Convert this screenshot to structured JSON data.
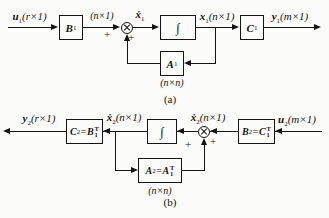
{
  "fig_a": {
    "caption": "(a)",
    "input": {
      "base": "u",
      "sub": "1",
      "dims": "(r×1)"
    },
    "block_B": {
      "base": "B",
      "sub": "1"
    },
    "dim_n1": "(n×1)",
    "plus_left": "+",
    "plus_right": "+",
    "xdot": {
      "base": "ẋ",
      "sub": "1",
      "dims": ""
    },
    "integrator": "∫",
    "state": {
      "base": "x",
      "sub": "1",
      "dims": "(n×1)"
    },
    "block_C": {
      "base": "C",
      "sub": "1"
    },
    "output": {
      "base": "y",
      "sub": "1",
      "dims": "(m×1)"
    },
    "block_A": {
      "base": "A",
      "sub": "1"
    },
    "dim_nn": "(n×n)"
  },
  "fig_b": {
    "caption": "(b)",
    "output": {
      "base": "y",
      "sub": "2",
      "dims": "(r×1)"
    },
    "block_C": {
      "lhs": "C",
      "lhs_sub": "2",
      "eq": "=",
      "rhs": "B",
      "rhs_sub": "1",
      "rhs_sup": "T"
    },
    "state": {
      "base": "ẋ",
      "sub": "2",
      "dims": "(n×1)"
    },
    "integrator": "∫",
    "xdot": {
      "base": "ẋ",
      "sub": "2",
      "dims": "(n×1)"
    },
    "plus_left": "+",
    "plus_right": "+",
    "block_B": {
      "lhs": "B",
      "lhs_sub": "2",
      "eq": "=",
      "rhs": "C",
      "rhs_sub": "1",
      "rhs_sup": "T"
    },
    "input": {
      "base": "u",
      "sub": "2",
      "dims": "(m×1)"
    },
    "block_A": {
      "lhs": "A",
      "lhs_sub": "2",
      "eq": "=",
      "rhs": "A",
      "rhs_sub": "1",
      "rhs_sup": "T"
    },
    "dim_nn": "(n×n)"
  }
}
